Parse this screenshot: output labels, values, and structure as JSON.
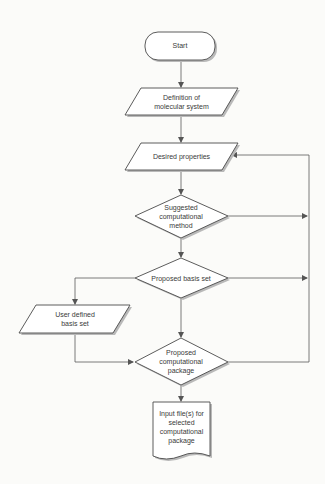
{
  "diagram": {
    "type": "flowchart",
    "colors": {
      "stroke": "#4a4a4a",
      "fill": "#ffffff",
      "shadow": "#b8b8b8",
      "text": "#3a3a3a",
      "background": "#fbfbf9"
    },
    "nodes": [
      {
        "id": "start",
        "shape": "terminator",
        "label": "Start"
      },
      {
        "id": "definition",
        "shape": "parallelogram",
        "label_line1": "Definition of",
        "label_line2": "molecular system"
      },
      {
        "id": "desired",
        "shape": "parallelogram",
        "label": "Desired properties"
      },
      {
        "id": "suggested",
        "shape": "diamond",
        "label_line1": "Suggested",
        "label_line2": "computational",
        "label_line3": "method"
      },
      {
        "id": "basis",
        "shape": "diamond",
        "label": "Proposed basis set"
      },
      {
        "id": "userbasis",
        "shape": "parallelogram",
        "label_line1": "User defined",
        "label_line2": "basis set"
      },
      {
        "id": "package",
        "shape": "diamond",
        "label_line1": "Proposed",
        "label_line2": "computational",
        "label_line3": "package"
      },
      {
        "id": "inputfiles",
        "shape": "document",
        "label_line1": "Input file(s) for",
        "label_line2": "selected",
        "label_line3": "computational",
        "label_line4": "package"
      }
    ],
    "edges": [
      {
        "from": "start",
        "to": "definition"
      },
      {
        "from": "definition",
        "to": "desired"
      },
      {
        "from": "desired",
        "to": "suggested"
      },
      {
        "from": "suggested",
        "to": "basis"
      },
      {
        "from": "suggested",
        "to": "desired",
        "via": "right loop"
      },
      {
        "from": "basis",
        "to": "package"
      },
      {
        "from": "basis",
        "to": "userbasis"
      },
      {
        "from": "basis",
        "to": "desired",
        "via": "right loop"
      },
      {
        "from": "userbasis",
        "to": "package"
      },
      {
        "from": "package",
        "to": "desired",
        "via": "right loop"
      },
      {
        "from": "package",
        "to": "inputfiles"
      }
    ]
  }
}
